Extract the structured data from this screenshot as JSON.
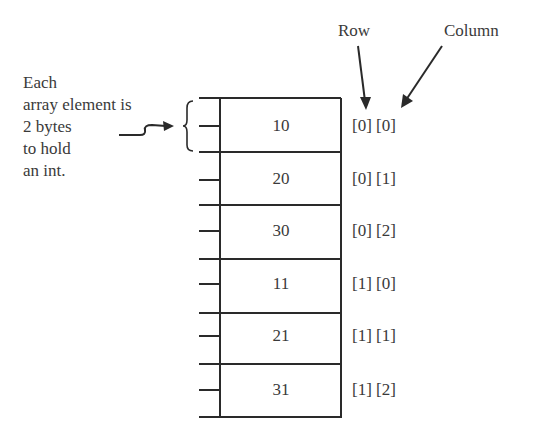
{
  "annotation": {
    "lines": [
      "Each",
      "array element is",
      "2 bytes",
      "to hold",
      "an int."
    ]
  },
  "axis_labels": {
    "row": "Row",
    "column": "Column"
  },
  "cells": [
    {
      "value": "10",
      "index": "[0] [0]"
    },
    {
      "value": "20",
      "index": "[0] [1]"
    },
    {
      "value": "30",
      "index": "[0] [2]"
    },
    {
      "value": "11",
      "index": "[1] [0]"
    },
    {
      "value": "21",
      "index": "[1] [1]"
    },
    {
      "value": "31",
      "index": "[1] [2]"
    }
  ],
  "colors": {
    "line": "#2a2a2a",
    "text": "#3a3a3a",
    "background": "#ffffff"
  }
}
